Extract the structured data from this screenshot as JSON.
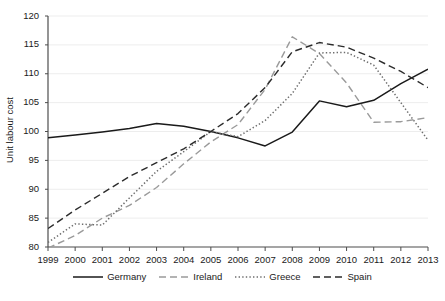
{
  "chart_data": {
    "type": "line",
    "title": "",
    "xlabel": "",
    "ylabel": "Unit labour cost",
    "x": [
      1999,
      2000,
      2001,
      2002,
      2003,
      2004,
      2005,
      2006,
      2007,
      2008,
      2009,
      2010,
      2011,
      2012,
      2013
    ],
    "categories": [
      "1999",
      "2000",
      "2001",
      "2002",
      "2003",
      "2004",
      "2005",
      "2006",
      "2007",
      "2008",
      "2009",
      "2010",
      "2011",
      "2012",
      "2013"
    ],
    "xlim": [
      1999,
      2013
    ],
    "ylim": [
      80,
      120
    ],
    "yticks": [
      80,
      85,
      90,
      95,
      100,
      105,
      110,
      115,
      120
    ],
    "xticks": [
      "1999",
      "2000",
      "2001",
      "2002",
      "2003",
      "2004",
      "2005",
      "2006",
      "2007",
      "2008",
      "2009",
      "2010",
      "2011",
      "2012",
      "2013"
    ],
    "grid": true,
    "grid_axis": "y",
    "legend_position": "bottom",
    "series": [
      {
        "name": "Germany",
        "style": "solid",
        "color": "#1a1a1a",
        "values": [
          98.9,
          99.4,
          99.9,
          100.5,
          101.4,
          100.9,
          100.0,
          98.9,
          97.5,
          99.9,
          105.3,
          104.3,
          105.4,
          108.3,
          110.8
        ]
      },
      {
        "name": "Ireland",
        "style": "dashed",
        "color": "#9a9a9a",
        "values": [
          79.8,
          82.0,
          85.0,
          87.2,
          90.3,
          94.4,
          98.2,
          101.2,
          107.3,
          116.4,
          113.5,
          108.4,
          101.6,
          101.7,
          102.4
        ]
      },
      {
        "name": "Greece",
        "style": "dotted",
        "color": "#6e6e6e",
        "values": [
          80.8,
          84.0,
          83.8,
          88.5,
          93.1,
          96.5,
          100.0,
          99.1,
          101.9,
          106.6,
          113.6,
          113.7,
          111.5,
          105.0,
          98.5
        ]
      },
      {
        "name": "Spain",
        "style": "dashed",
        "color": "#2b2b2b",
        "values": [
          83.2,
          86.4,
          89.3,
          92.2,
          94.6,
          97.0,
          100.0,
          103.1,
          107.6,
          113.8,
          115.4,
          114.6,
          112.7,
          110.4,
          107.6
        ]
      }
    ]
  },
  "axis": {
    "y_title": "Unit labour cost",
    "y_ticks": [
      "120",
      "115",
      "110",
      "105",
      "100",
      "95",
      "90",
      "85",
      "80"
    ],
    "x_ticks": [
      "1999",
      "2000",
      "2001",
      "2002",
      "2003",
      "2004",
      "2005",
      "2006",
      "2007",
      "2008",
      "2009",
      "2010",
      "2011",
      "2012",
      "2013"
    ]
  },
  "legend": {
    "items": [
      {
        "label": "Germany",
        "style": "solid",
        "color": "#1a1a1a"
      },
      {
        "label": "Ireland",
        "style": "dashed",
        "color": "#9a9a9a"
      },
      {
        "label": "Greece",
        "style": "dotted",
        "color": "#6e6e6e"
      },
      {
        "label": "Spain",
        "style": "dashed",
        "color": "#2b2b2b"
      }
    ]
  },
  "colors": {
    "background": "#ffffff",
    "axis": "#4d4d4d",
    "grid": "#ededed",
    "text": "#1a1a1a"
  }
}
